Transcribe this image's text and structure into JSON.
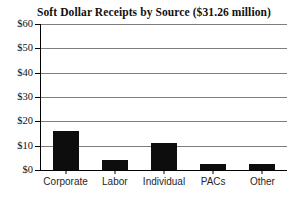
{
  "chart_data": {
    "type": "bar",
    "title": "Soft Dollar Receipts by Source ($31.26 million)",
    "categories": [
      "Corporate",
      "Labor",
      "Individual",
      "PACs",
      "Other"
    ],
    "values": [
      16,
      4,
      11,
      2.3,
      2.3
    ],
    "xlabel": "",
    "ylabel": "",
    "ylim": [
      0,
      60
    ],
    "ytick_interval": 10,
    "ytick_labels": [
      "$0",
      "$10",
      "$20",
      "$30",
      "$40",
      "$50",
      "$60"
    ],
    "grid": true,
    "legend_position": "none",
    "bar_color": "#0d0d0d",
    "gridline_color": "#7d7d7d",
    "axis_color": "#000000",
    "background_color": "#ffffff"
  }
}
